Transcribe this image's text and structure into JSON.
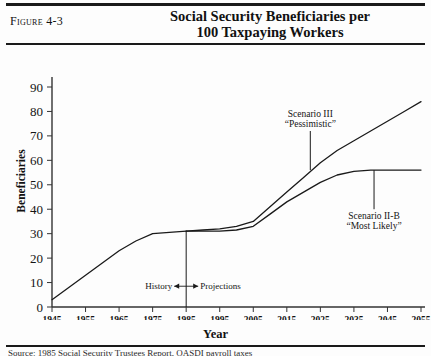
{
  "figure": {
    "label": "Figure 4-3",
    "title_line1": "Social Security Beneficiaries per",
    "title_line2": "100 Taxpaying Workers",
    "caption": "Source: 1985 Social Security Trustees Report, OASDI payroll taxes"
  },
  "chart_data": {
    "type": "line",
    "title": "Social Security Beneficiaries per 100 Taxpaying Workers",
    "xlabel": "Year",
    "ylabel": "Beneficiaries",
    "xlim": [
      1945,
      2055
    ],
    "ylim": [
      0,
      90
    ],
    "grid": false,
    "legend_position": "inline-annotation",
    "xticks": [
      1945,
      1955,
      1965,
      1975,
      1985,
      1995,
      2005,
      2015,
      2025,
      2035,
      2045,
      2055
    ],
    "yticks": [
      0,
      10,
      20,
      30,
      40,
      50,
      60,
      70,
      80,
      90
    ],
    "series": [
      {
        "name": "History",
        "x": [
          1945,
          1950,
          1955,
          1960,
          1965,
          1970,
          1975,
          1980,
          1985
        ],
        "values": [
          3,
          8,
          13,
          18,
          23,
          27,
          30,
          30.5,
          31
        ]
      },
      {
        "name": "Scenario III “Pessimistic”",
        "x": [
          1985,
          1990,
          1995,
          2000,
          2005,
          2010,
          2015,
          2020,
          2025,
          2030,
          2035,
          2040,
          2045,
          2050,
          2055
        ],
        "values": [
          31,
          31.5,
          32,
          33,
          35,
          41,
          47,
          53,
          59,
          64,
          68,
          72,
          76,
          80,
          84
        ]
      },
      {
        "name": "Scenario II-B “Most Likely”",
        "x": [
          1985,
          1990,
          1995,
          2000,
          2005,
          2010,
          2015,
          2020,
          2025,
          2030,
          2035,
          2040,
          2045,
          2050,
          2055
        ],
        "values": [
          31,
          31,
          31,
          31.5,
          33,
          38,
          43,
          47,
          51,
          54,
          55.5,
          56,
          56,
          56,
          56
        ]
      }
    ],
    "annotations": [
      {
        "name": "scenario-3",
        "line1": "Scenario III",
        "line2": "“Pessimistic”",
        "leader_x": 2022,
        "leader_y_top": 72,
        "leader_y_bottom": 56
      },
      {
        "name": "scenario-2b",
        "line1": "Scenario II-B",
        "line2": "“Most Likely”",
        "leader_x": 2041,
        "leader_y_top": 56,
        "leader_y_bottom": 40
      },
      {
        "name": "history-projections-divider",
        "left_label": "History",
        "right_label": "Projections",
        "divider_x": 1985,
        "divider_y_top": 31,
        "divider_y_bottom": 0
      }
    ]
  }
}
